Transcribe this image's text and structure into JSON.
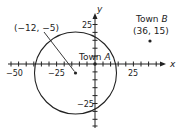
{
  "diagram": {
    "axes": {
      "x_label": "x",
      "y_label": "y",
      "x_ticks": [
        {
          "value": -50,
          "label": "−50"
        },
        {
          "value": -25,
          "label": "−25"
        },
        {
          "value": 25,
          "label": "25"
        }
      ],
      "y_ticks": [
        {
          "value": 25,
          "label": "25"
        },
        {
          "value": -25,
          "label": "−25"
        }
      ],
      "tick_spacing": 5
    },
    "circle": {
      "center_label": "(−12, −5)",
      "center": [
        -12,
        -5
      ],
      "radius": 27
    },
    "town_a": {
      "label_prefix": "Town ",
      "label_letter": "A",
      "position": [
        0,
        0
      ]
    },
    "town_b": {
      "label_prefix": "Town ",
      "label_letter": "B",
      "coords_label": "(36, 15)",
      "position": [
        36,
        15
      ]
    },
    "colors": {
      "stroke": "#222222",
      "background": "#ffffff"
    }
  }
}
